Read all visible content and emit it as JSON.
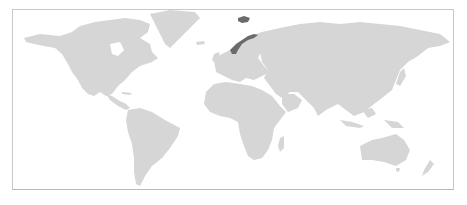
{
  "map": {
    "title": "World map with Norway highlighted",
    "projection": "Miller-like world",
    "highlighted_countries": [
      "Norway",
      "Svalbard"
    ],
    "colors": {
      "background": "#ffffff",
      "land": "#d6d6d6",
      "highlight": "#6b6b6b",
      "border": "#c8c8c8"
    }
  }
}
